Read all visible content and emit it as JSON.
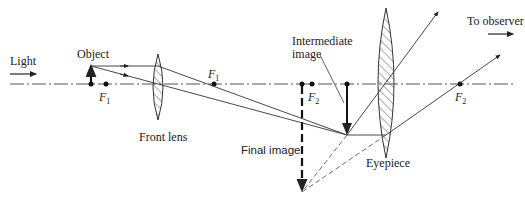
{
  "diagram": {
    "labels": {
      "light": "Light",
      "object": "Object",
      "front_lens": "Front lens",
      "intermediate_image_line1": "Intermediate",
      "intermediate_image_line2": "image",
      "final_image": "Final image",
      "eyepiece": "Eyepiece",
      "to_observer": "To observer",
      "f1_left": "F",
      "f1_left_sub": "1",
      "f1_right": "F",
      "f1_right_sub": "1",
      "f2_left": "F",
      "f2_left_sub": "2",
      "f2_right": "F",
      "f2_right_sub": "2"
    },
    "colors": {
      "line": "#333333",
      "hatch": "#444444"
    }
  }
}
